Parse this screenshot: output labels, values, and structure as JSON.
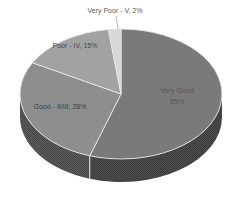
{
  "chart_data": {
    "type": "pie",
    "style": "3d-pie",
    "title": "",
    "legend_position": "none",
    "labels_on_chart": true,
    "direction": "clockwise",
    "start_angle_deg": 0,
    "background": "#ffffff",
    "outline_color": "#e6e6e6",
    "leader_line_color": "#b9b9b9",
    "categories": [
      "Very Good",
      "Good - II/III",
      "Poor - IV",
      "Very Poor - V"
    ],
    "values": [
      55,
      28,
      15,
      2
    ],
    "slices": [
      {
        "name": "Very Good",
        "value": 55,
        "label_line1": "Very Good",
        "label_line2": "55%",
        "color_top": "#7a7a7a",
        "color_side": "#4d4d4d"
      },
      {
        "name": "Good - II/III",
        "value": 28,
        "label": "Good - II/III, 28%",
        "color_top": "#8e8e8e",
        "color_side": "#5c5c5c"
      },
      {
        "name": "Poor - IV",
        "value": 15,
        "label": "Poor - IV, 15%",
        "color_top": "#a2a2a2",
        "color_side": "#707070"
      },
      {
        "name": "Very Poor - V",
        "value": 2,
        "label": "Very Poor - V, 2%",
        "color_top": "#d8d8d8",
        "color_side": "#a8a8a8"
      }
    ]
  }
}
